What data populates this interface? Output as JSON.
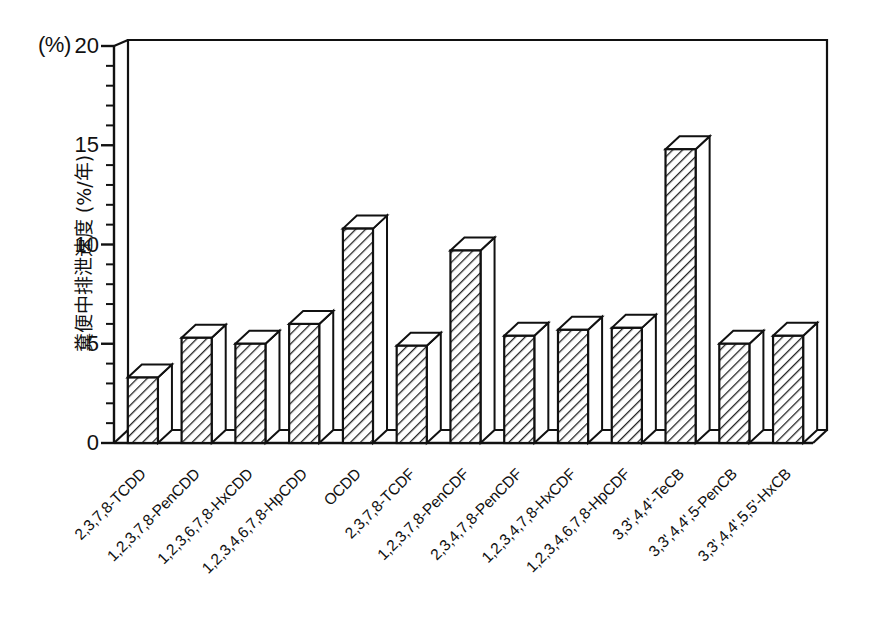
{
  "chart_data": {
    "type": "bar",
    "title": "",
    "subtitle": "",
    "unit_label": "(%)",
    "xlabel": "",
    "ylabel": "糞便中排泄速度 (%/年)",
    "ylim": [
      0,
      20
    ],
    "ytick_labels": [
      "0",
      "5",
      "10",
      "15",
      "20"
    ],
    "ytick_values": [
      0,
      5,
      10,
      15,
      20
    ],
    "minor_tick_step": 1,
    "grid": false,
    "legend": null,
    "style": "3d-hatched-bars",
    "categories": [
      "2,3,7,8-TCDD",
      "1,2,3,7,8-PenCDD",
      "1,2,3,6,7,8-HxCDD",
      "1,2,3,4,6,7,8-HpCDD",
      "OCDD",
      "2,3,7,8-TCDF",
      "1,2,3,7,8-PenCDF",
      "2,3,4,7,8-PenCDF",
      "1,2,3,4,7,8-HxCDF",
      "1,2,3,4,6,7,8-HpCDF",
      "3,3',4,4'-TeCB",
      "3,3',4,4',5-PenCB",
      "3,3',4,4',5,5'-HxCB"
    ],
    "values": [
      3.3,
      5.3,
      5.0,
      6.0,
      10.8,
      4.9,
      9.7,
      5.4,
      5.7,
      5.8,
      14.8,
      5.0,
      5.4
    ]
  },
  "colors": {
    "axis": "#111111",
    "bar_outline": "#111111",
    "bar_fill": "#ffffff",
    "hatch": "#222222",
    "background": "#ffffff"
  }
}
